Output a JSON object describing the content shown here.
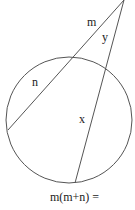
{
  "diagram": {
    "type": "circle-two-secants",
    "colors": {
      "stroke": "#555555",
      "text": "#222222",
      "background": "#ffffff"
    },
    "external_point": {
      "x": 124,
      "y": 0
    },
    "circle": {
      "cx": 69,
      "cy": 120,
      "r": 63
    },
    "secants": [
      {
        "name": "secant-1",
        "from": {
          "x": 124,
          "y": 0
        },
        "to": {
          "x": 8,
          "y": 130
        },
        "external_label": "m",
        "internal_label": "n"
      },
      {
        "name": "secant-2",
        "from": {
          "x": 124,
          "y": 0
        },
        "to": {
          "x": 75,
          "y": 183
        },
        "external_label": "y",
        "internal_label": "x"
      }
    ],
    "labels": {
      "m": "m",
      "n": "n",
      "y": "y",
      "x": "x"
    },
    "equation": "m(m+n) ="
  }
}
